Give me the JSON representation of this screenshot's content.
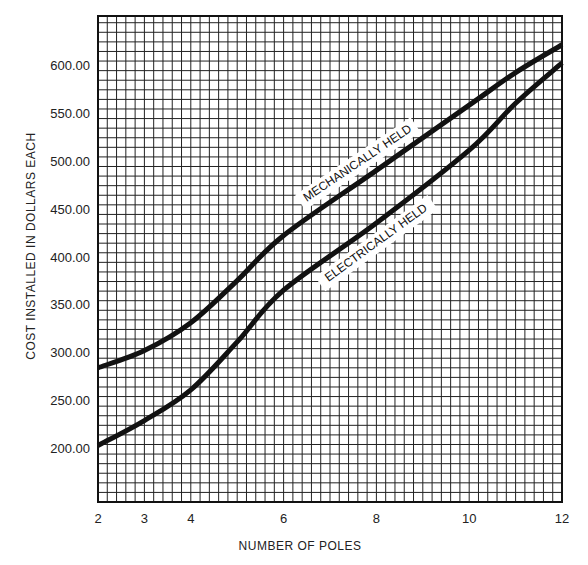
{
  "chart_data": {
    "type": "line",
    "title": "",
    "xlabel": "NUMBER OF POLES",
    "ylabel": "COST INSTALLED IN DOLLARS EACH",
    "x_ticks": [
      2,
      3,
      4,
      6,
      8,
      10,
      12
    ],
    "x_tick_labels": [
      "2",
      "3",
      "4",
      "6",
      "8",
      "10",
      "12"
    ],
    "y_ticks": [
      200,
      250,
      300,
      350,
      400,
      450,
      500,
      550,
      600
    ],
    "y_tick_labels": [
      "200.00",
      "250.00",
      "300.00",
      "350.00",
      "400.00",
      "450.00",
      "500.00",
      "550.00",
      "600.00"
    ],
    "xlim": [
      2,
      12
    ],
    "ylim": [
      145,
      652
    ],
    "grid": true,
    "grid_minor_x_step": 0.2,
    "grid_minor_y_step": 10,
    "x": [
      2,
      3,
      4,
      5,
      6,
      8,
      10,
      11,
      12
    ],
    "series": [
      {
        "name": "MECHANICALLY HELD",
        "values": [
          285,
          303,
          332,
          376,
          423,
          491,
          559,
          593,
          622
        ]
      },
      {
        "name": "ELECTRICALLY HELD",
        "values": [
          204,
          230,
          262,
          312,
          366,
          436,
          512,
          561,
          603
        ]
      }
    ],
    "annotations": [
      {
        "text": "MECHANICALLY HELD",
        "series": 0,
        "x": 7.6,
        "y": 498,
        "angle": -34
      },
      {
        "text": "ELECTRICALLY HELD",
        "series": 1,
        "x": 8.0,
        "y": 415,
        "angle": -36
      }
    ],
    "legend": "none (inline curve labels)",
    "colors": {
      "line": "#111111",
      "grid": "#222222",
      "background": "#ffffff"
    }
  }
}
